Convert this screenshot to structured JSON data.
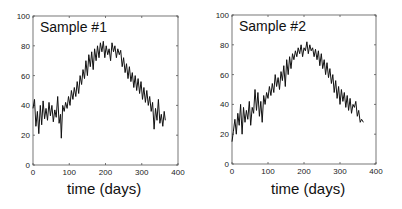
{
  "chart_data": [
    {
      "type": "line",
      "title": "Sample #1",
      "xlabel": "time (days)",
      "ylabel": "",
      "xlim": [
        0,
        400
      ],
      "ylim": [
        0,
        100
      ],
      "xticks": [
        0,
        100,
        200,
        300,
        400
      ],
      "yticks": [
        0,
        20,
        40,
        60,
        80,
        100
      ],
      "grid": false,
      "legend": null,
      "series": [
        {
          "name": "Sample #1",
          "x": [
            0,
            4,
            8,
            12,
            16,
            20,
            24,
            28,
            32,
            36,
            40,
            44,
            48,
            52,
            56,
            60,
            64,
            68,
            72,
            76,
            78,
            82,
            86,
            90,
            94,
            98,
            102,
            106,
            110,
            114,
            118,
            122,
            126,
            130,
            134,
            138,
            142,
            146,
            150,
            154,
            158,
            162,
            166,
            170,
            174,
            178,
            182,
            186,
            190,
            194,
            198,
            202,
            206,
            210,
            214,
            218,
            222,
            226,
            230,
            234,
            238,
            242,
            246,
            250,
            254,
            258,
            262,
            266,
            270,
            274,
            278,
            282,
            286,
            290,
            294,
            298,
            302,
            306,
            310,
            314,
            318,
            322,
            326,
            330,
            334,
            338,
            342,
            346,
            350,
            354,
            358,
            362,
            365
          ],
          "values": [
            38,
            44,
            26,
            36,
            21,
            40,
            27,
            43,
            31,
            38,
            30,
            42,
            33,
            40,
            29,
            37,
            32,
            46,
            28,
            34,
            18,
            40,
            36,
            42,
            38,
            46,
            40,
            50,
            44,
            52,
            46,
            56,
            48,
            60,
            54,
            64,
            58,
            70,
            60,
            74,
            66,
            76,
            64,
            78,
            70,
            80,
            72,
            82,
            76,
            83,
            72,
            80,
            74,
            78,
            70,
            82,
            76,
            80,
            72,
            78,
            74,
            77,
            66,
            72,
            62,
            68,
            58,
            66,
            56,
            62,
            52,
            60,
            50,
            58,
            48,
            56,
            44,
            52,
            42,
            50,
            40,
            46,
            36,
            42,
            24,
            38,
            30,
            44,
            28,
            34,
            26,
            36,
            30
          ],
          "color": "#111111"
        }
      ]
    },
    {
      "type": "line",
      "title": "Sample #2",
      "xlabel": "time (days)",
      "ylabel": "",
      "xlim": [
        0,
        400
      ],
      "ylim": [
        0,
        100
      ],
      "xticks": [
        0,
        100,
        200,
        300,
        400
      ],
      "yticks": [
        0,
        20,
        40,
        60,
        80,
        100
      ],
      "grid": false,
      "legend": null,
      "series": [
        {
          "name": "Sample #2",
          "x": [
            0,
            4,
            8,
            12,
            16,
            20,
            24,
            28,
            32,
            36,
            40,
            44,
            48,
            52,
            56,
            60,
            64,
            68,
            72,
            76,
            80,
            84,
            88,
            92,
            96,
            100,
            104,
            108,
            112,
            116,
            120,
            124,
            128,
            132,
            136,
            140,
            144,
            148,
            152,
            156,
            160,
            164,
            168,
            172,
            176,
            180,
            184,
            188,
            192,
            196,
            200,
            204,
            208,
            212,
            216,
            220,
            224,
            228,
            232,
            236,
            240,
            244,
            248,
            252,
            256,
            260,
            264,
            268,
            272,
            276,
            280,
            284,
            288,
            292,
            296,
            300,
            304,
            308,
            312,
            316,
            320,
            324,
            328,
            332,
            336,
            340,
            344,
            348,
            352,
            356,
            360,
            365
          ],
          "values": [
            15,
            22,
            30,
            20,
            34,
            26,
            40,
            20,
            38,
            28,
            36,
            30,
            42,
            26,
            38,
            34,
            50,
            36,
            48,
            32,
            42,
            28,
            46,
            40,
            48,
            44,
            52,
            46,
            54,
            48,
            60,
            52,
            58,
            50,
            62,
            56,
            66,
            52,
            70,
            60,
            72,
            64,
            74,
            70,
            76,
            72,
            78,
            74,
            80,
            72,
            78,
            76,
            82,
            74,
            80,
            76,
            78,
            72,
            77,
            70,
            76,
            66,
            74,
            64,
            70,
            60,
            68,
            58,
            64,
            54,
            60,
            48,
            56,
            44,
            52,
            40,
            50,
            42,
            48,
            38,
            46,
            36,
            44,
            34,
            40,
            38,
            42,
            32,
            36,
            28,
            30,
            28
          ],
          "color": "#111111"
        }
      ]
    }
  ],
  "panels": [
    {
      "title": "Sample #1",
      "xlabel": "time (days)",
      "yticks": [
        "0",
        "20",
        "40",
        "60",
        "80",
        "100"
      ],
      "xticks": [
        "0",
        "100",
        "200",
        "300",
        "400"
      ]
    },
    {
      "title": "Sample #2",
      "xlabel": "time (days)",
      "yticks": [
        "0",
        "20",
        "40",
        "60",
        "80",
        "100"
      ],
      "xticks": [
        "0",
        "100",
        "200",
        "300",
        "400"
      ]
    }
  ]
}
